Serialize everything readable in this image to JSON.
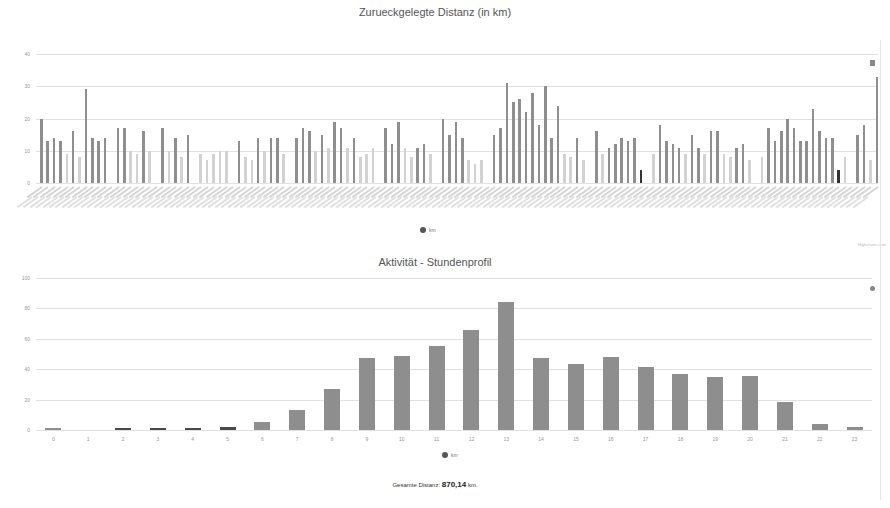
{
  "charts": {
    "distance": {
      "title": "Zurueckgelegte Distanz (in km)",
      "legend": "km",
      "credit": "Highcharts.com"
    },
    "hourly": {
      "title": "Aktivität - Stundenprofil",
      "legend": "km",
      "credit": "Highcharts.com"
    }
  },
  "footer": {
    "label": "Gesamte Distanz:",
    "value": "870,14",
    "unit": "km."
  },
  "colors": {
    "bar_dark": "#8f8f8f",
    "bar_light": "#d2d2d2",
    "bar_highlight": "#333333",
    "hourly_bar": "#8e8e8e",
    "grid": "#e2e2e2"
  },
  "chart_data": [
    {
      "type": "bar",
      "title": "Zurueckgelegte Distanz (in km)",
      "xlabel": "",
      "ylabel": "",
      "ylim": [
        0,
        40
      ],
      "yticks": [
        0,
        10,
        20,
        30,
        40
      ],
      "grid": true,
      "legend": {
        "entries": [
          "km"
        ],
        "position": "bottom-center"
      },
      "note": "~132 daily bars; x-axis date labels illegible (rotated); light bars and dark bars alternate by category",
      "categories_count": 132,
      "values": [
        20,
        13,
        14,
        13,
        9,
        16,
        8,
        29,
        14,
        13,
        14,
        0,
        17,
        17,
        10,
        9,
        16,
        10,
        0,
        17,
        10,
        14,
        8,
        15,
        0,
        9,
        7,
        9,
        10,
        10,
        0,
        13,
        8,
        7,
        14,
        10,
        14,
        14,
        9,
        0,
        14,
        17,
        16,
        10,
        15,
        11,
        19,
        17,
        11,
        14,
        8,
        9,
        11,
        0,
        17,
        12,
        19,
        11,
        8,
        11,
        12,
        9,
        0,
        20,
        15,
        19,
        14,
        7,
        6,
        7,
        0,
        15,
        17,
        31,
        25,
        26,
        22,
        28,
        18,
        30,
        14,
        24,
        9,
        8,
        14,
        7,
        0,
        16,
        9,
        11,
        12,
        14,
        13,
        14,
        4,
        0,
        9,
        18,
        13,
        12,
        11,
        9,
        15,
        11,
        9,
        16,
        16,
        9,
        8,
        11,
        12,
        7,
        0,
        8,
        17,
        13,
        16,
        20,
        17,
        13,
        13,
        23,
        16,
        14,
        14,
        4,
        8,
        0,
        15,
        18,
        7,
        33
      ],
      "shade": [
        "d",
        "d",
        "d",
        "d",
        "l",
        "d",
        "l",
        "d",
        "d",
        "d",
        "d",
        "l",
        "d",
        "d",
        "l",
        "l",
        "d",
        "l",
        "l",
        "d",
        "l",
        "d",
        "l",
        "d",
        "l",
        "l",
        "l",
        "l",
        "l",
        "l",
        "l",
        "d",
        "l",
        "l",
        "d",
        "l",
        "d",
        "d",
        "l",
        "l",
        "d",
        "d",
        "d",
        "l",
        "d",
        "l",
        "d",
        "d",
        "l",
        "d",
        "l",
        "l",
        "l",
        "l",
        "d",
        "d",
        "d",
        "l",
        "l",
        "d",
        "d",
        "l",
        "l",
        "d",
        "d",
        "d",
        "d",
        "l",
        "l",
        "l",
        "l",
        "d",
        "d",
        "d",
        "d",
        "d",
        "d",
        "d",
        "d",
        "d",
        "d",
        "d",
        "l",
        "l",
        "d",
        "l",
        "l",
        "d",
        "l",
        "d",
        "d",
        "d",
        "d",
        "d",
        "h",
        "l",
        "l",
        "d",
        "d",
        "d",
        "d",
        "l",
        "d",
        "d",
        "l",
        "d",
        "d",
        "l",
        "l",
        "d",
        "d",
        "l",
        "l",
        "l",
        "d",
        "d",
        "d",
        "d",
        "d",
        "d",
        "d",
        "d",
        "d",
        "d",
        "d",
        "h",
        "l",
        "l",
        "d",
        "d",
        "l",
        "d"
      ]
    },
    {
      "type": "bar",
      "title": "Aktivität - Stundenprofil",
      "xlabel": "",
      "ylabel": "",
      "ylim": [
        0,
        100
      ],
      "yticks": [
        0,
        20,
        40,
        60,
        80,
        100
      ],
      "grid": true,
      "legend": {
        "entries": [
          "km"
        ],
        "position": "bottom-center"
      },
      "categories": [
        "0",
        "1",
        "2",
        "3",
        "4",
        "5",
        "6",
        "7",
        "8",
        "9",
        "10",
        "11",
        "12",
        "13",
        "14",
        "15",
        "16",
        "17",
        "18",
        "19",
        "20",
        "21",
        "22",
        "23"
      ],
      "values": [
        1,
        0,
        1,
        1,
        1.5,
        2,
        5.5,
        13,
        27,
        47.5,
        48.5,
        55,
        65.5,
        84.5,
        47.5,
        43.5,
        48,
        41.5,
        37,
        35,
        35.5,
        18.5,
        4,
        2
      ]
    }
  ]
}
